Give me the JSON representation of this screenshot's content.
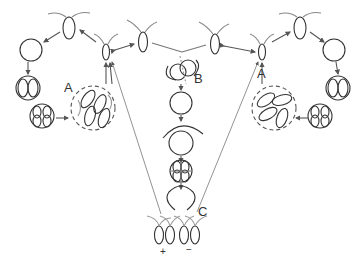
{
  "diagram": {
    "labels": {
      "a_left": "A",
      "a_right": "A",
      "b": "B",
      "c": "C",
      "plus": "+",
      "minus": "−"
    },
    "stroke_color": "#333333",
    "dashed_color": "#555555",
    "line_color": "#777777"
  }
}
